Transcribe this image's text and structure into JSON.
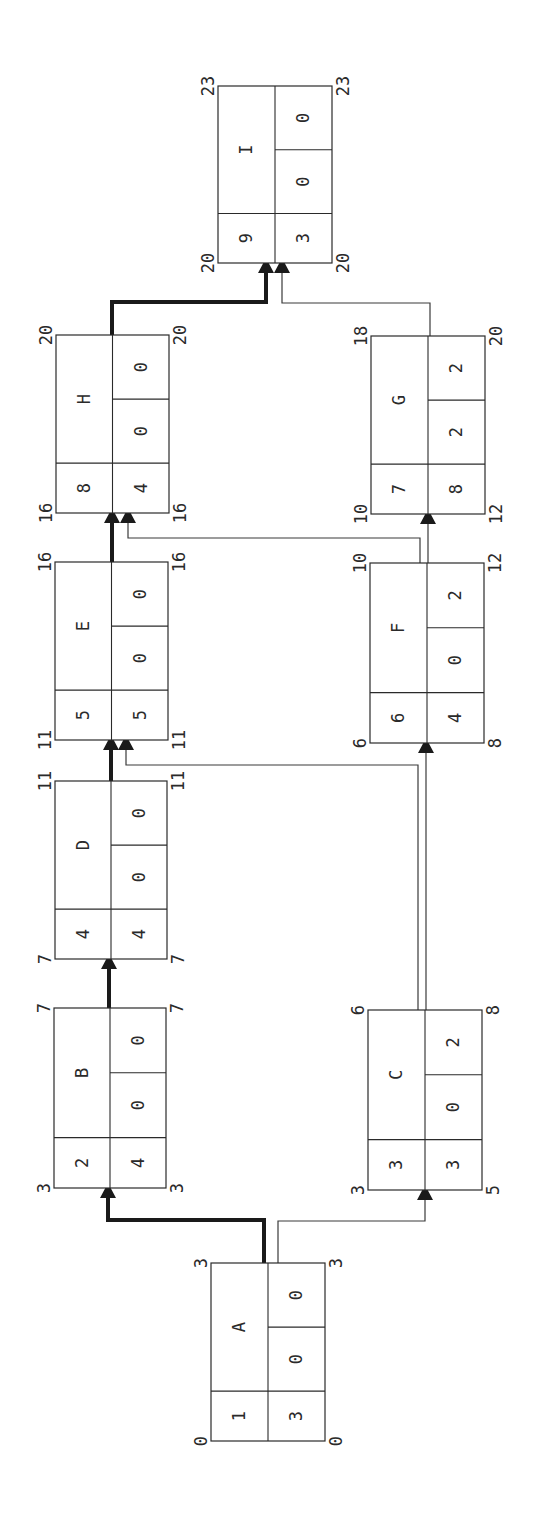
{
  "diagram": {
    "type": "precedence-network",
    "orientation": "rotated-90-ccw",
    "colors": {
      "line": "#2a2a2a",
      "critical": "#1a1a1a",
      "background": "#ffffff"
    },
    "legend_cells": [
      "activity_no",
      "name",
      "duration",
      "total_float",
      "free_float"
    ],
    "nodes": [
      {
        "id": "A",
        "no": "1",
        "name": "A",
        "duration": "3",
        "tf": "0",
        "ff": "0",
        "es": "0",
        "ef": "3",
        "ls": "0",
        "lf": "3",
        "x": 211,
        "y": 1263,
        "w": 114,
        "h": 178
      },
      {
        "id": "B",
        "no": "2",
        "name": "B",
        "duration": "4",
        "tf": "0",
        "ff": "0",
        "es": "3",
        "ef": "7",
        "ls": "3",
        "lf": "7",
        "x": 54,
        "y": 1008,
        "w": 112,
        "h": 180
      },
      {
        "id": "C",
        "no": "3",
        "name": "C",
        "duration": "3",
        "tf": "0",
        "ff": "2",
        "es": "3",
        "ef": "6",
        "ls": "5",
        "lf": "8",
        "x": 368,
        "y": 1010,
        "w": 114,
        "h": 180
      },
      {
        "id": "D",
        "no": "4",
        "name": "D",
        "duration": "4",
        "tf": "0",
        "ff": "0",
        "es": "7",
        "ef": "11",
        "ls": "7",
        "lf": "11",
        "x": 55,
        "y": 781,
        "w": 112,
        "h": 178
      },
      {
        "id": "E",
        "no": "5",
        "name": "E",
        "duration": "5",
        "tf": "0",
        "ff": "0",
        "es": "11",
        "ef": "16",
        "ls": "11",
        "lf": "16",
        "x": 55,
        "y": 562,
        "w": 113,
        "h": 178
      },
      {
        "id": "F",
        "no": "6",
        "name": "F",
        "duration": "4",
        "tf": "0",
        "ff": "2",
        "es": "6",
        "ef": "10",
        "ls": "8",
        "lf": "12",
        "x": 370,
        "y": 563,
        "w": 114,
        "h": 180
      },
      {
        "id": "G",
        "no": "7",
        "name": "G",
        "duration": "8",
        "tf": "2",
        "ff": "2",
        "es": "10",
        "ef": "18",
        "ls": "12",
        "lf": "20",
        "x": 371,
        "y": 336,
        "w": 114,
        "h": 178
      },
      {
        "id": "H",
        "no": "8",
        "name": "H",
        "duration": "4",
        "tf": "0",
        "ff": "0",
        "es": "16",
        "ef": "20",
        "ls": "16",
        "lf": "20",
        "x": 56,
        "y": 335,
        "w": 113,
        "h": 178
      },
      {
        "id": "I",
        "no": "9",
        "name": "I",
        "duration": "3",
        "tf": "0",
        "ff": "0",
        "es": "20",
        "ef": "23",
        "ls": "20",
        "lf": "23",
        "x": 218,
        "y": 86,
        "w": 114,
        "h": 177
      }
    ],
    "links": [
      {
        "from": "A",
        "to": "B",
        "critical": true,
        "points": [
          [
            264,
            1263
          ],
          [
            264,
            1220
          ],
          [
            108,
            1220
          ],
          [
            108,
            1196
          ]
        ]
      },
      {
        "from": "A",
        "to": "C",
        "critical": false,
        "points": [
          [
            278,
            1263
          ],
          [
            278,
            1221
          ],
          [
            425,
            1221
          ],
          [
            425,
            1198
          ]
        ]
      },
      {
        "from": "B",
        "to": "D",
        "critical": true,
        "points": [
          [
            109,
            1008
          ],
          [
            109,
            967
          ]
        ]
      },
      {
        "from": "D",
        "to": "E",
        "critical": true,
        "points": [
          [
            111,
            781
          ],
          [
            111,
            748
          ]
        ]
      },
      {
        "from": "C",
        "to": "E",
        "critical": false,
        "points": [
          [
            418,
            1010
          ],
          [
            418,
            765
          ],
          [
            126,
            765
          ],
          [
            126,
            748
          ]
        ]
      },
      {
        "from": "C",
        "to": "F",
        "critical": false,
        "points": [
          [
            426,
            1010
          ],
          [
            426,
            751
          ]
        ]
      },
      {
        "from": "E",
        "to": "H",
        "critical": true,
        "points": [
          [
            112,
            562
          ],
          [
            112,
            521
          ]
        ]
      },
      {
        "from": "F",
        "to": "H",
        "critical": false,
        "points": [
          [
            420,
            563
          ],
          [
            420,
            538
          ],
          [
            128,
            538
          ],
          [
            128,
            521
          ]
        ]
      },
      {
        "from": "F",
        "to": "G",
        "critical": false,
        "points": [
          [
            428,
            563
          ],
          [
            428,
            522
          ]
        ]
      },
      {
        "from": "H",
        "to": "I",
        "critical": true,
        "points": [
          [
            112,
            335
          ],
          [
            112,
            302
          ],
          [
            266,
            302
          ],
          [
            266,
            271
          ]
        ]
      },
      {
        "from": "G",
        "to": "I",
        "critical": false,
        "points": [
          [
            430,
            336
          ],
          [
            430,
            303
          ],
          [
            282,
            303
          ],
          [
            282,
            271
          ]
        ]
      }
    ]
  }
}
